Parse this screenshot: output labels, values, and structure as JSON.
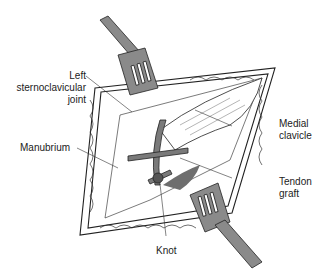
{
  "figure": {
    "type": "surgical illustration",
    "labels": {
      "left_sternoclavicular_joint": "Left\nsternoclavicular\njoint",
      "manubrium": "Manubrium",
      "medial_clavicle": "Medial\nclavicle",
      "tendon_graft": "Tendon\ngraft",
      "knot": "Knot"
    },
    "colors": {
      "line": "#222222",
      "retractor": "#8a8a8a",
      "tendon": "#7a7a7a",
      "shadow": "#6e6e6e",
      "tissue": "#ffffff"
    }
  }
}
